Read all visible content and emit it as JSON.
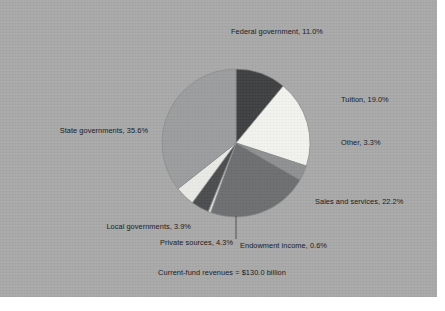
{
  "chart_data": {
    "type": "pie",
    "title": "",
    "caption": "Current-fund revenues = $130.0 billion",
    "unit": "percent",
    "total_label": "$130.0 billion",
    "legend_position": "outside-labels",
    "grid": false,
    "start_angle_deg": 0,
    "direction": "clockwise",
    "categories": [
      "Federal government",
      "Tuition",
      "Other",
      "Sales and services",
      "Endowment income",
      "Local governments",
      "Private sources",
      "State governments"
    ],
    "values": [
      11.0,
      19.0,
      3.3,
      22.2,
      0.6,
      3.9,
      4.3,
      35.6
    ],
    "slices": [
      {
        "name": "Federal government",
        "value": 11.0,
        "label": "Federal government, 11.0%",
        "color": "#3f4042"
      },
      {
        "name": "Tuition",
        "value": 19.0,
        "label": "Tuition, 19.0%",
        "color": "#f2f2ee"
      },
      {
        "name": "Other",
        "value": 3.3,
        "label": "Other, 3.3%",
        "color": "#8e9092"
      },
      {
        "name": "Sales and services",
        "value": 22.2,
        "label": "Sales and services, 22.2%",
        "color": "#6d6f71"
      },
      {
        "name": "Endowment income",
        "value": 0.6,
        "label": "Endowment income, 0.6%",
        "color": "#d8d8d4"
      },
      {
        "name": "Local governments",
        "value": 3.9,
        "label": "Local governments, 3.9%",
        "color": "#4b4d4f"
      },
      {
        "name": "Private sources",
        "value": 4.3,
        "label": "Private sources, 4.3%",
        "color": "#e9e9e5"
      },
      {
        "name": "State governments",
        "value": 35.6,
        "label": "State governments, 35.6%",
        "color": "#9b9d9e"
      }
    ]
  },
  "labels": {
    "federal": "Federal government, 11.0%",
    "tuition": "Tuition, 19.0%",
    "other": "Other, 3.3%",
    "sales": "Sales and services, 22.2%",
    "state": "State governments, 35.6%",
    "local": "Local governments, 3.9%",
    "private": "Private sources, 4.3%",
    "endowment": "Endowment income, 0.6%",
    "caption": "Current-fund revenues = $130.0 billion"
  },
  "colors": {
    "background": "#a9a9a9",
    "page": "#ffffff",
    "text": "#16181a",
    "slice_outline": "#8a8a8a",
    "leader_line": "#3a3a3a"
  }
}
